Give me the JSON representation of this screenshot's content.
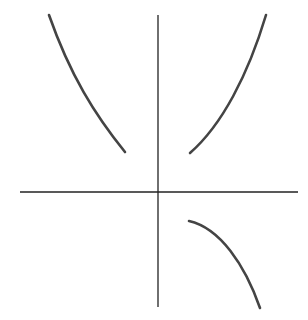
{
  "figure": {
    "type": "graph-sketch",
    "colors": {
      "axis": "#222222",
      "curve": "#444444",
      "background": "#ffffff"
    },
    "axes": {
      "x_axis": {
        "x1": 20,
        "y1": 192,
        "x2": 298,
        "y2": 192
      },
      "y_axis": {
        "x1": 158,
        "y1": 15,
        "x2": 158,
        "y2": 307
      }
    },
    "curves": [
      {
        "name": "upper-left-branch",
        "path": "M49,15 C70,75 95,115 125,152"
      },
      {
        "name": "upper-right-branch",
        "path": "M190,153 C222,125 248,75 266,15"
      },
      {
        "name": "lower-right-branch",
        "path": "M189,221 C220,228 245,265 260,308"
      }
    ]
  }
}
